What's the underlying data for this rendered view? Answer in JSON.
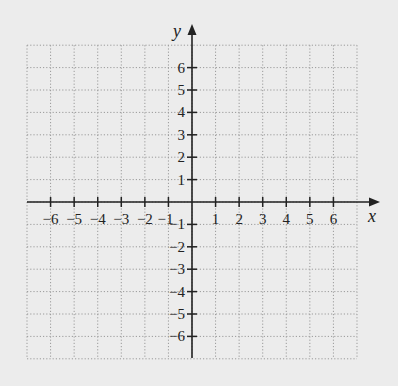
{
  "chart_data": {
    "type": "scatter",
    "title": "",
    "xlabel": "x",
    "ylabel": "y",
    "xlim": [
      -7,
      7
    ],
    "ylim": [
      -7,
      7
    ],
    "grid": true,
    "grid_style": "dotted",
    "x_ticks": [
      -6,
      -5,
      -4,
      -3,
      -2,
      -1,
      1,
      2,
      3,
      4,
      5,
      6
    ],
    "y_ticks": [
      -6,
      -5,
      -4,
      -3,
      -2,
      -1,
      1,
      2,
      3,
      4,
      5,
      6
    ],
    "x_tick_labels": [
      "−6",
      "−5",
      "−4",
      "−3",
      "−2",
      "−1",
      "1",
      "2",
      "3",
      "4",
      "5",
      "6"
    ],
    "y_tick_labels": [
      "−6",
      "−5",
      "−4",
      "−3",
      "−2",
      "−1",
      "1",
      "2",
      "3",
      "4",
      "5",
      "6"
    ],
    "series": []
  },
  "axes": {
    "x_label": "x",
    "y_label": "y"
  },
  "colors": {
    "background": "#ececec",
    "axis": "#222222",
    "grid": "#9a9a9a"
  }
}
